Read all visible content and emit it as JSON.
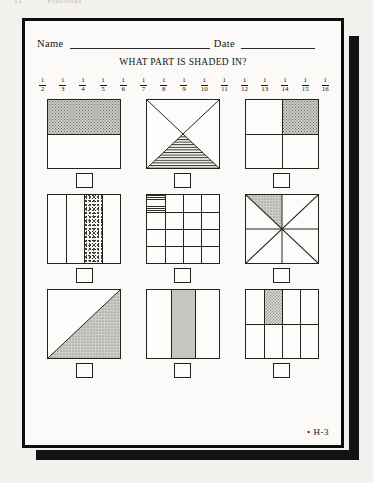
{
  "running_head": {
    "page_number": "11",
    "section": "Fractions"
  },
  "sheet": {
    "name_label": "Name",
    "date_label": "Date",
    "title": "WHAT PART IS SHADED IN?",
    "footer_code": "• H-3"
  },
  "scale": {
    "label": "unit-fraction-number-line",
    "fractions": [
      {
        "num": "1",
        "den": "2"
      },
      {
        "num": "1",
        "den": "3"
      },
      {
        "num": "1",
        "den": "4"
      },
      {
        "num": "1",
        "den": "5"
      },
      {
        "num": "1",
        "den": "6"
      },
      {
        "num": "1",
        "den": "7"
      },
      {
        "num": "1",
        "den": "8"
      },
      {
        "num": "1",
        "den": "9"
      },
      {
        "num": "1",
        "den": "10"
      },
      {
        "num": "1",
        "den": "11"
      },
      {
        "num": "1",
        "den": "12"
      },
      {
        "num": "1",
        "den": "13"
      },
      {
        "num": "1",
        "den": "14"
      },
      {
        "num": "1",
        "den": "15"
      },
      {
        "num": "1",
        "den": "16"
      }
    ]
  },
  "problems": [
    {
      "id": "problem-1",
      "shape": "square-halves-horizontal",
      "parts": 2,
      "shaded": 1,
      "fraction": "1/2",
      "fill": "dots",
      "answer": ""
    },
    {
      "id": "problem-2",
      "shape": "square-two-diagonals",
      "parts": 4,
      "shaded": 1,
      "fraction": "1/4",
      "fill": "hlines",
      "answer": ""
    },
    {
      "id": "problem-3",
      "shape": "square-quarters-grid",
      "parts": 4,
      "shaded": 1,
      "fraction": "1/4",
      "fill": "dots",
      "answer": ""
    },
    {
      "id": "problem-4",
      "shape": "square-four-vertical-strips",
      "parts": 4,
      "shaded": 1,
      "fraction": "1/4",
      "fill": "speckle",
      "answer": ""
    },
    {
      "id": "problem-5",
      "shape": "square-4x4-grid",
      "parts": 16,
      "shaded": 1,
      "fraction": "1/16",
      "fill": "hlines",
      "answer": ""
    },
    {
      "id": "problem-6",
      "shape": "square-eight-wedges",
      "parts": 8,
      "shaded": 1,
      "fraction": "1/8",
      "fill": "dots",
      "answer": ""
    },
    {
      "id": "problem-7",
      "shape": "square-single-diagonal",
      "parts": 2,
      "shaded": 1,
      "fraction": "1/2",
      "fill": "dots",
      "answer": ""
    },
    {
      "id": "problem-8",
      "shape": "square-three-vertical-strips",
      "parts": 3,
      "shaded": 1,
      "fraction": "1/3",
      "fill": "grey",
      "answer": ""
    },
    {
      "id": "problem-9",
      "shape": "square-4x2-grid",
      "parts": 8,
      "shaded": 1,
      "fraction": "1/8",
      "fill": "check",
      "answer": ""
    }
  ],
  "colors": {
    "paper": "#fbfaf8",
    "ink": "#16150f",
    "rule": "#23221d",
    "border": "#0e0e0e",
    "shadow": "#131313",
    "backdrop": "#f2f1ee"
  }
}
